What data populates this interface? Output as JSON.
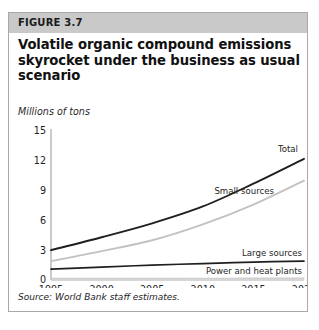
{
  "figure": {
    "number_label": "FIGURE 3.7",
    "title": "Volatile organic compound emissions skyrocket under the business as usual scenario",
    "subtitle": "Millions of tons",
    "source": "Source: World Bank staff estimates.",
    "band_color": "#c9c9c9",
    "border_color": "#a8a8a8"
  },
  "chart_data": {
    "type": "line",
    "title": "Volatile organic compound emissions skyrocket under the business as usual scenario",
    "subtitle": "Millions of tons",
    "xlabel": "",
    "ylabel": "Millions of tons",
    "x": [
      1995,
      2000,
      2005,
      2010,
      2015,
      2020
    ],
    "xticklabels": [
      "1995",
      "2000",
      "2005",
      "2010",
      "2015",
      "2020"
    ],
    "yticks": [
      0,
      3,
      6,
      9,
      12,
      15
    ],
    "yticklabels": [
      "0",
      "3",
      "6",
      "9",
      "12",
      "15"
    ],
    "xlim": [
      1995,
      2020
    ],
    "ylim": [
      0,
      15
    ],
    "grid": false,
    "legend": "inline-labels",
    "series": [
      {
        "name": "Total",
        "color": "#1f1f1f",
        "width": 1.9,
        "values": [
          3.0,
          4.3,
          5.7,
          7.4,
          9.7,
          12.2
        ]
      },
      {
        "name": "Small sources",
        "color": "#c2c2c2",
        "width": 1.9,
        "values": [
          1.9,
          2.9,
          4.0,
          5.6,
          7.6,
          10.0
        ]
      },
      {
        "name": "Large sources",
        "color": "#1f1f1f",
        "width": 1.7,
        "values": [
          1.1,
          1.3,
          1.5,
          1.65,
          1.8,
          1.9
        ]
      },
      {
        "name": "Power and heat plants",
        "color": "#cfcfcf",
        "width": 1.4,
        "values": [
          0.15,
          0.15,
          0.15,
          0.16,
          0.17,
          0.18
        ]
      }
    ],
    "annotations": [
      {
        "text": "Total",
        "series": "Total"
      },
      {
        "text": "Small sources",
        "series": "Small sources"
      },
      {
        "text": "Large sources",
        "series": "Large sources"
      },
      {
        "text": "Power and heat plants",
        "series": "Power and heat plants"
      }
    ]
  }
}
